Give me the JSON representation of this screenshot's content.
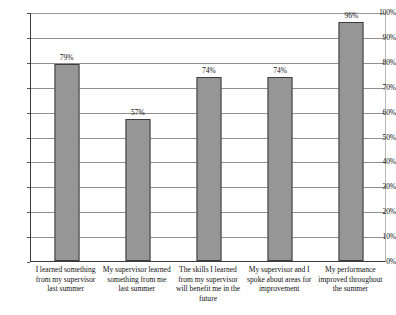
{
  "chart_data": {
    "type": "bar",
    "title": "",
    "subtitle": "",
    "xlabel": "",
    "ylabel": "",
    "ylim": [
      0,
      100
    ],
    "grid": true,
    "legend": false,
    "legend_position": "none",
    "orientation": "vertical",
    "value_suffix": "%",
    "bar_color": "#969696",
    "bar_border_color": "#3d3d3d",
    "gridline_color": "#8e8e8e",
    "axis_color": "#3a3a3a",
    "background_color": "#ffffff",
    "categories": [
      "I learned something from my supervisor last summer",
      "My supervisor learned something from me last summer",
      "The skills I learned from my supervisor will benefit me in the future",
      "My supervisor and I spoke about areas for improvement",
      "My performance improved throughout the summer"
    ],
    "values": [
      79,
      57,
      74,
      74,
      96
    ],
    "data_labels": [
      "79%",
      "57%",
      "74%",
      "74%",
      "96%"
    ],
    "y_ticks": [
      0,
      10,
      20,
      30,
      40,
      50,
      60,
      70,
      80,
      90,
      100
    ],
    "y_tick_labels": [
      "0%",
      "10%",
      "20%",
      "30%",
      "40%",
      "50%",
      "60%",
      "70%",
      "80%",
      "90%",
      "100%"
    ]
  }
}
